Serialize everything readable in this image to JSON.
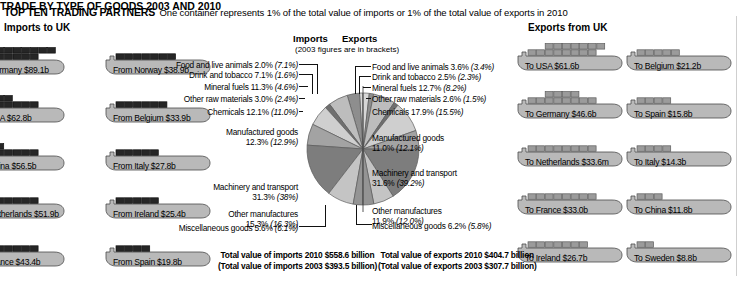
{
  "header": {
    "title": "TOP TEN TRADING PARTNERS",
    "subtitle": "One container represents 1% of the total value of imports or 1% of the total value of exports in 2010"
  },
  "columns": {
    "imports_heading": "Imports to UK",
    "exports_heading": "Exports from UK"
  },
  "centre": {
    "title": "TRADE BY TYPE OF GOODS 2003 AND 2010",
    "imports_label": "Imports",
    "exports_label": "Exports",
    "bracket_note": "(2003 figures are in brackets)"
  },
  "imports_ships": [
    {
      "label": "From Germany $89.1b",
      "value": 89.1,
      "containers": 16
    },
    {
      "label": "From Norway $38.9b",
      "value": 38.9,
      "containers": 7
    },
    {
      "label": "From USA $62.8b",
      "value": 62.8,
      "containers": 11
    },
    {
      "label": "From Belgium $33.9b",
      "value": 33.9,
      "containers": 6
    },
    {
      "label": "From China $56.5b",
      "value": 56.5,
      "containers": 10
    },
    {
      "label": "From Italy $27.8b",
      "value": 27.8,
      "containers": 5
    },
    {
      "label": "From Netherlands $51.9b",
      "value": 51.9,
      "containers": 9
    },
    {
      "label": "From Ireland $25.4b",
      "value": 25.4,
      "containers": 5
    },
    {
      "label": "From France $43.4b",
      "value": 43.4,
      "containers": 8
    },
    {
      "label": "From Spain $19.8b",
      "value": 19.8,
      "containers": 4
    }
  ],
  "exports_ships": [
    {
      "label": "To USA $61.6b",
      "value": 61.6,
      "containers": 15
    },
    {
      "label": "To Belgium $21.2b",
      "value": 21.2,
      "containers": 5
    },
    {
      "label": "To Germany $46.6b",
      "value": 46.6,
      "containers": 12
    },
    {
      "label": "To Spain $15.8b",
      "value": 15.8,
      "containers": 4
    },
    {
      "label": "To Netherlands $33.6m",
      "value": 33.6,
      "containers": 8
    },
    {
      "label": "To Italy $14.3b",
      "value": 14.3,
      "containers": 4
    },
    {
      "label": "To France $33.0b",
      "value": 33.0,
      "containers": 8
    },
    {
      "label": "To China $11.8b",
      "value": 11.8,
      "containers": 3
    },
    {
      "label": "To Ireland $26.7b",
      "value": 26.7,
      "containers": 7
    },
    {
      "label": "To Sweden $8.8b",
      "value": 8.8,
      "containers": 2
    }
  ],
  "totals": {
    "imports_2010": "Total value of imports 2010 $558.6 billion",
    "imports_2003": "(Total value of imports 2003 $393.5 billion)",
    "exports_2010": "Total value of exports 2010 $404.7 billion",
    "exports_2003": "(Total value of exports 2003 $307.7 billion)"
  },
  "import_labels": [
    {
      "name": "Food and live animals",
      "v2010": "2.0%",
      "v2003": "(7.1%)"
    },
    {
      "name": "Drink and tobacco",
      "v2010": "7.1%",
      "v2003": "(1.6%)"
    },
    {
      "name": "Mineral fuels",
      "v2010": "11.3%",
      "v2003": "(4.6%)"
    },
    {
      "name": "Other raw materials",
      "v2010": "3.0%",
      "v2003": "(2.4%)"
    },
    {
      "name": "Chemicals",
      "v2010": "12.1%",
      "v2003": "(11.0%)"
    },
    {
      "name": "Manufactured goods",
      "v2010": "12.3%",
      "v2003": "(12.9%)"
    },
    {
      "name": "Machinery and transport",
      "v2010": "31.3%",
      "v2003": "(38%)"
    },
    {
      "name": "Other manufactures",
      "v2010": "15.3%",
      "v2003": "(16.3%)"
    },
    {
      "name": "Miscellaneous goods",
      "v2010": "5.6%",
      "v2003": "(6.1%)"
    }
  ],
  "export_labels": [
    {
      "name": "Food and live animals",
      "v2010": "3.6%",
      "v2003": "(3.4%)"
    },
    {
      "name": "Drink and tobacco",
      "v2010": "2.5%",
      "v2003": "(2.3%)"
    },
    {
      "name": "Mineral fuels",
      "v2010": "12.7%",
      "v2003": "(8.2%)"
    },
    {
      "name": "Other raw materials",
      "v2010": "2.6%",
      "v2003": "(1.5%)"
    },
    {
      "name": "Chemicals",
      "v2010": "17.9%",
      "v2003": "(15.5%)"
    },
    {
      "name": "Manufactured goods",
      "v2010": "11.0%",
      "v2003": "(12.1%)"
    },
    {
      "name": "Machinery and transport",
      "v2010": "31.6%",
      "v2003": "(39.2%)"
    },
    {
      "name": "Other manufactures",
      "v2010": "11.9%",
      "v2003": "(12.0%)"
    },
    {
      "name": "Miscellaneous goods",
      "v2010": "6.2%",
      "v2003": "(5.8%)"
    }
  ],
  "chart_data": {
    "type": "pie",
    "title": "TRADE BY TYPE OF GOODS 2003 AND 2010",
    "note": "(2003 figures are in brackets)",
    "legend_position": "labels-with-leader-lines",
    "halves": [
      {
        "name": "Imports",
        "side": "left",
        "total_2010_usd_billion": 558.6,
        "total_2003_usd_billion": 393.5,
        "categories": [
          "Food and live animals",
          "Drink and tobacco",
          "Mineral fuels",
          "Other raw materials",
          "Chemicals",
          "Manufactured goods",
          "Machinery and transport",
          "Other manufactures",
          "Miscellaneous goods"
        ],
        "values_2010": [
          2.0,
          7.1,
          11.3,
          3.0,
          12.1,
          12.3,
          31.3,
          15.3,
          5.6
        ],
        "values_2003": [
          7.1,
          1.6,
          4.6,
          2.4,
          11.0,
          12.9,
          38.0,
          16.3,
          6.1
        ]
      },
      {
        "name": "Exports",
        "side": "right",
        "total_2010_usd_billion": 404.7,
        "total_2003_usd_billion": 307.7,
        "categories": [
          "Food and live animals",
          "Drink and tobacco",
          "Mineral fuels",
          "Other raw materials",
          "Chemicals",
          "Manufactured goods",
          "Machinery and transport",
          "Other manufactures",
          "Miscellaneous goods"
        ],
        "values_2010": [
          3.6,
          2.5,
          12.7,
          2.6,
          17.9,
          11.0,
          31.6,
          11.9,
          6.2
        ],
        "values_2003": [
          3.4,
          2.3,
          8.2,
          1.5,
          15.5,
          12.1,
          39.2,
          12.0,
          5.8
        ]
      }
    ],
    "ships_imports": {
      "unit": "1 container = 1% of total import value",
      "categories": [
        "Germany",
        "Norway",
        "USA",
        "Belgium",
        "China",
        "Italy",
        "Netherlands",
        "Ireland",
        "France",
        "Spain"
      ],
      "values": [
        89.1,
        38.9,
        62.8,
        33.9,
        56.5,
        27.8,
        51.9,
        25.4,
        43.4,
        19.8
      ],
      "unit_label": "$ billion"
    },
    "ships_exports": {
      "unit": "1 container = 1% of total export value",
      "categories": [
        "USA",
        "Belgium",
        "Germany",
        "Spain",
        "Netherlands",
        "Italy",
        "France",
        "China",
        "Ireland",
        "Sweden"
      ],
      "values": [
        61.6,
        21.2,
        46.6,
        15.8,
        33.6,
        14.3,
        33.0,
        11.8,
        26.7,
        8.8
      ],
      "unit_label": "$ billion"
    }
  },
  "colors": {
    "import_ship_hull": "#b9b9b9",
    "import_container": "#262626",
    "export_ship_hull": "#b9b9b9",
    "export_container": "#9b9b9b",
    "background": "#ffffff"
  }
}
